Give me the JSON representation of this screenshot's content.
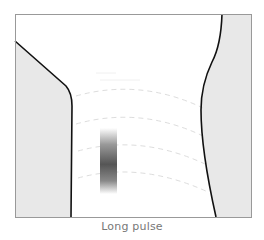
{
  "caption": "Long pulse",
  "colors": {
    "frame": "#999999",
    "tissue_fill": "#e8e8e8",
    "boundary": "#111111",
    "dashed_arcs": "#dddddd",
    "pulse_dark": "#555555"
  }
}
